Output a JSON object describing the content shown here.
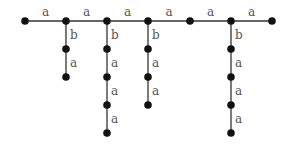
{
  "diagram": {
    "type": "labeled-tree",
    "colors": {
      "edge": "#333333",
      "node": "#111111",
      "label": "#555555"
    },
    "nodes": [
      {
        "id": "m0",
        "x": 25,
        "y": 21
      },
      {
        "id": "m1",
        "x": 66,
        "y": 21
      },
      {
        "id": "m2",
        "x": 107,
        "y": 21
      },
      {
        "id": "m3",
        "x": 148,
        "y": 21
      },
      {
        "id": "m4",
        "x": 190,
        "y": 21
      },
      {
        "id": "m5",
        "x": 231,
        "y": 21
      },
      {
        "id": "m6",
        "x": 272,
        "y": 21
      },
      {
        "id": "c1_1",
        "x": 66,
        "y": 49
      },
      {
        "id": "c1_2",
        "x": 66,
        "y": 77
      },
      {
        "id": "c2_1",
        "x": 107,
        "y": 49
      },
      {
        "id": "c2_2",
        "x": 107,
        "y": 77
      },
      {
        "id": "c2_3",
        "x": 107,
        "y": 105
      },
      {
        "id": "c2_4",
        "x": 107,
        "y": 133
      },
      {
        "id": "c3_1",
        "x": 148,
        "y": 49
      },
      {
        "id": "c3_2",
        "x": 148,
        "y": 77
      },
      {
        "id": "c3_3",
        "x": 148,
        "y": 105
      },
      {
        "id": "c5_1",
        "x": 231,
        "y": 49
      },
      {
        "id": "c5_2",
        "x": 231,
        "y": 77
      },
      {
        "id": "c5_3",
        "x": 231,
        "y": 105
      },
      {
        "id": "c5_4",
        "x": 231,
        "y": 133
      }
    ],
    "edges": [
      {
        "from": "m0",
        "to": "m1",
        "label": "a"
      },
      {
        "from": "m1",
        "to": "m2",
        "label": "a"
      },
      {
        "from": "m2",
        "to": "m3",
        "label": "a"
      },
      {
        "from": "m3",
        "to": "m4",
        "label": "a"
      },
      {
        "from": "m4",
        "to": "m5",
        "label": "a"
      },
      {
        "from": "m5",
        "to": "m6",
        "label": "a"
      },
      {
        "from": "m1",
        "to": "c1_1",
        "label": "b"
      },
      {
        "from": "c1_1",
        "to": "c1_2",
        "label": "a"
      },
      {
        "from": "m2",
        "to": "c2_1",
        "label": "b"
      },
      {
        "from": "c2_1",
        "to": "c2_2",
        "label": "a"
      },
      {
        "from": "c2_2",
        "to": "c2_3",
        "label": "a"
      },
      {
        "from": "c2_3",
        "to": "c2_4",
        "label": "a"
      },
      {
        "from": "m3",
        "to": "c3_1",
        "label": "b"
      },
      {
        "from": "c3_1",
        "to": "c3_2",
        "label": "a"
      },
      {
        "from": "c3_2",
        "to": "c3_3",
        "label": "a"
      },
      {
        "from": "m5",
        "to": "c5_1",
        "label": "b"
      },
      {
        "from": "c5_1",
        "to": "c5_2",
        "label": "a"
      },
      {
        "from": "c5_2",
        "to": "c5_3",
        "label": "a"
      },
      {
        "from": "c5_3",
        "to": "c5_4",
        "label": "a"
      }
    ]
  }
}
